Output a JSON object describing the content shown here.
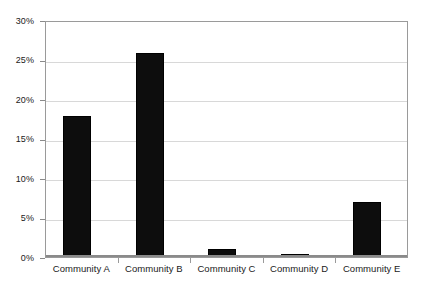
{
  "chart_data": {
    "type": "bar",
    "title": "",
    "subtitle": "",
    "xlabel": "",
    "ylabel": "",
    "categories": [
      "Community A",
      "Community B",
      "Community C",
      "Community D",
      "Community E"
    ],
    "values": [
      18,
      26,
      1,
      0.4,
      7
    ],
    "value_unit": "%",
    "ylim": [
      0,
      30
    ],
    "ytick_values": [
      0,
      5,
      10,
      15,
      20,
      25,
      30
    ],
    "ytick_labels": [
      "0%",
      "5%",
      "10%",
      "15%",
      "20%",
      "25%",
      "30%"
    ],
    "grid": true,
    "legend": false,
    "legend_position": "none",
    "series": [
      {
        "name": "",
        "values": [
          18,
          26,
          1,
          0.4,
          7
        ],
        "color": "#0d0d0d"
      }
    ],
    "colors": {
      "bar": "#0d0d0d",
      "bar_border": "#000000",
      "gridline": "#d8d8d8",
      "plot_border": "#9a9a9a",
      "axis_baseline": "#8a8a8a",
      "background": "#ffffff",
      "tick_text": "#1a1a1a"
    }
  }
}
